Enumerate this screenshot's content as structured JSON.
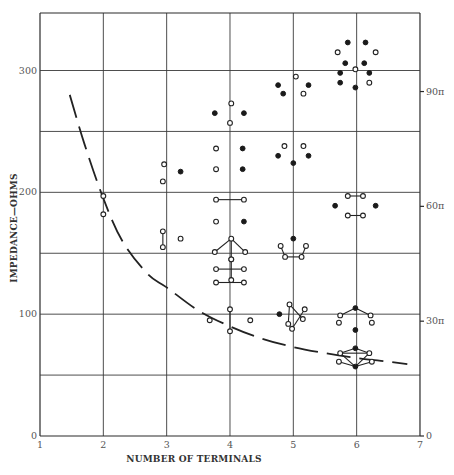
{
  "chart_data": {
    "type": "scatter",
    "title": "",
    "xlabel": "NUMBER OF TERMINALS",
    "ylabel": "IMPEDANCE—OHMS",
    "xlim": [
      1,
      7
    ],
    "ylim": [
      0,
      345
    ],
    "x_ticks": [
      "1",
      "2",
      "3",
      "4",
      "5",
      "6",
      "7"
    ],
    "y_ticks_left": [
      {
        "value": 0,
        "label": "0"
      },
      {
        "value": 100,
        "label": "100"
      },
      {
        "value": 200,
        "label": "200"
      },
      {
        "value": 300,
        "label": "300"
      }
    ],
    "y_ticks_right": [
      {
        "value": 0,
        "label": "0"
      },
      {
        "value": 94.25,
        "label": "30π"
      },
      {
        "value": 188.5,
        "label": "60π"
      },
      {
        "value": 282.74,
        "label": "90π"
      }
    ],
    "grid": {
      "x_every": 1,
      "y_every": 50
    },
    "legend": "none",
    "curve": {
      "style": "dashed",
      "description": "Minimum impedance vs number of terminals",
      "points": [
        [
          1.47,
          280
        ],
        [
          1.7,
          240
        ],
        [
          2.0,
          195
        ],
        [
          2.3,
          160
        ],
        [
          2.7,
          133
        ],
        [
          3.0,
          122
        ],
        [
          3.5,
          103
        ],
        [
          4.0,
          90
        ],
        [
          4.5,
          80
        ],
        [
          5.0,
          73
        ],
        [
          5.5,
          68
        ],
        [
          6.0,
          64
        ],
        [
          6.5,
          61
        ],
        [
          6.8,
          59
        ]
      ]
    },
    "configurations": [
      {
        "n": 2,
        "label": "2-terminal pair",
        "points": [
          [
            2.0,
            197,
            "open"
          ],
          [
            2.0,
            182,
            "open"
          ]
        ],
        "bonds": []
      },
      {
        "n": 3,
        "label": "3-terminal upper",
        "points": [
          [
            2.96,
            223,
            "open"
          ],
          [
            2.94,
            209,
            "open"
          ],
          [
            3.22,
            217,
            "filled"
          ]
        ],
        "bonds": []
      },
      {
        "n": 3,
        "label": "3-terminal lower",
        "points": [
          [
            2.94,
            168,
            "open"
          ],
          [
            2.94,
            155,
            "open"
          ],
          [
            3.22,
            162,
            "open"
          ]
        ],
        "bonds": [
          [
            0,
            1
          ]
        ]
      },
      {
        "n": 4,
        "label": "4-terminal top",
        "points": [
          [
            4.02,
            273,
            "open"
          ],
          [
            3.76,
            265,
            "filled"
          ],
          [
            4.22,
            265,
            "filled"
          ],
          [
            4.0,
            257,
            "open"
          ]
        ],
        "bonds": []
      },
      {
        "n": 4,
        "label": "4-terminal pair rows A",
        "points": [
          [
            3.78,
            236,
            "open"
          ],
          [
            4.2,
            236,
            "filled"
          ],
          [
            3.78,
            219,
            "open"
          ],
          [
            4.2,
            219,
            "filled"
          ]
        ],
        "bonds": []
      },
      {
        "n": 4,
        "label": "4-terminal bonded pair",
        "points": [
          [
            3.78,
            194,
            "open"
          ],
          [
            4.22,
            194,
            "open"
          ]
        ],
        "bonds": [
          [
            0,
            1
          ]
        ]
      },
      {
        "n": 4,
        "label": "4-terminal mixed pair",
        "points": [
          [
            3.78,
            176,
            "open"
          ],
          [
            4.22,
            176,
            "filled"
          ]
        ],
        "bonds": []
      },
      {
        "n": 4,
        "label": "4-terminal tripod",
        "points": [
          [
            4.02,
            162,
            "open"
          ],
          [
            3.76,
            151,
            "open"
          ],
          [
            4.24,
            151,
            "open"
          ],
          [
            4.02,
            145,
            "open"
          ]
        ],
        "bonds": [
          [
            0,
            1
          ],
          [
            0,
            2
          ],
          [
            0,
            3
          ]
        ]
      },
      {
        "n": 4,
        "label": "4-terminal cross",
        "points": [
          [
            4.02,
            145,
            "open"
          ],
          [
            3.78,
            137,
            "open"
          ],
          [
            4.22,
            137,
            "open"
          ],
          [
            4.02,
            128,
            "open"
          ]
        ],
        "bonds": [
          [
            1,
            2
          ],
          [
            0,
            3
          ]
        ]
      },
      {
        "n": 4,
        "label": "4-terminal bonded pair low",
        "points": [
          [
            3.78,
            126,
            "open"
          ],
          [
            4.22,
            126,
            "open"
          ]
        ],
        "bonds": [
          [
            0,
            1
          ]
        ]
      },
      {
        "n": 4,
        "label": "4-terminal bottom",
        "points": [
          [
            4.0,
            104,
            "open"
          ],
          [
            3.68,
            95,
            "open"
          ],
          [
            4.32,
            95,
            "open"
          ],
          [
            4.0,
            86,
            "open"
          ]
        ],
        "bonds": [
          [
            0,
            3
          ]
        ]
      },
      {
        "n": 5,
        "label": "5-terminal top",
        "points": [
          [
            5.04,
            295,
            "open"
          ],
          [
            4.76,
            288,
            "filled"
          ],
          [
            5.24,
            288,
            "filled"
          ],
          [
            4.84,
            281,
            "filled"
          ],
          [
            5.16,
            281,
            "open"
          ]
        ],
        "bonds": []
      },
      {
        "n": 5,
        "label": "5-terminal middle",
        "points": [
          [
            4.86,
            238,
            "open"
          ],
          [
            5.16,
            238,
            "open"
          ],
          [
            4.76,
            230,
            "filled"
          ],
          [
            5.24,
            230,
            "filled"
          ],
          [
            5.0,
            224,
            "filled"
          ]
        ],
        "bonds": []
      },
      {
        "n": 5,
        "label": "5-terminal bonded",
        "points": [
          [
            5.0,
            162,
            "filled"
          ],
          [
            4.8,
            156,
            "open"
          ],
          [
            5.2,
            156,
            "open"
          ],
          [
            4.87,
            147,
            "open"
          ],
          [
            5.13,
            147,
            "open"
          ]
        ],
        "bonds": [
          [
            1,
            3
          ],
          [
            3,
            4
          ],
          [
            4,
            2
          ]
        ]
      },
      {
        "n": 5,
        "label": "5-terminal star",
        "points": [
          [
            4.78,
            100,
            "filled"
          ],
          [
            4.94,
            108,
            "open"
          ],
          [
            5.18,
            104,
            "open"
          ],
          [
            4.92,
            92,
            "open"
          ],
          [
            5.15,
            96,
            "open"
          ],
          [
            4.98,
            88,
            "open"
          ]
        ],
        "bonds": [
          [
            1,
            4
          ],
          [
            2,
            5
          ],
          [
            1,
            3
          ]
        ]
      },
      {
        "n": 6,
        "label": "6-terminal top",
        "points": [
          [
            5.86,
            323,
            "filled"
          ],
          [
            6.14,
            323,
            "filled"
          ],
          [
            5.7,
            315,
            "open"
          ],
          [
            6.3,
            315,
            "open"
          ],
          [
            5.82,
            306,
            "filled"
          ],
          [
            6.12,
            306,
            "filled"
          ],
          [
            5.98,
            301,
            "open"
          ],
          [
            5.74,
            298,
            "filled"
          ],
          [
            6.2,
            298,
            "filled"
          ],
          [
            5.74,
            290,
            "filled"
          ],
          [
            6.2,
            290,
            "open"
          ],
          [
            5.98,
            286,
            "filled"
          ]
        ],
        "bonds": []
      },
      {
        "n": 6,
        "label": "6-terminal ring",
        "points": [
          [
            5.86,
            197,
            "open"
          ],
          [
            6.1,
            197,
            "open"
          ],
          [
            5.66,
            189,
            "filled"
          ],
          [
            6.3,
            189,
            "filled"
          ],
          [
            5.86,
            181,
            "open"
          ],
          [
            6.1,
            181,
            "open"
          ]
        ],
        "bonds": [
          [
            0,
            1
          ],
          [
            4,
            5
          ]
        ]
      },
      {
        "n": 6,
        "label": "6-terminal hex",
        "points": [
          [
            5.98,
            105,
            "filled"
          ],
          [
            5.74,
            99,
            "open"
          ],
          [
            6.22,
            99,
            "open"
          ],
          [
            5.72,
            93,
            "open"
          ],
          [
            6.24,
            93,
            "open"
          ],
          [
            5.98,
            87,
            "filled"
          ]
        ],
        "bonds": [
          [
            0,
            1
          ],
          [
            0,
            2
          ]
        ]
      },
      {
        "n": 6,
        "label": "6-terminal compact",
        "points": [
          [
            5.98,
            72,
            "filled"
          ],
          [
            5.74,
            68,
            "open"
          ],
          [
            6.2,
            68,
            "open"
          ],
          [
            5.72,
            61,
            "open"
          ],
          [
            6.24,
            61,
            "open"
          ],
          [
            5.98,
            57,
            "filled"
          ]
        ],
        "bonds": [
          [
            0,
            1
          ],
          [
            0,
            2
          ],
          [
            1,
            2
          ],
          [
            3,
            5
          ],
          [
            4,
            5
          ],
          [
            1,
            5
          ],
          [
            2,
            5
          ]
        ]
      }
    ]
  }
}
